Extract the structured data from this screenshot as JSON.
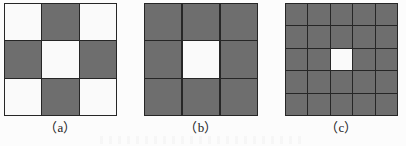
{
  "figure": {
    "background_color": "#fcfcfc",
    "cell_gray_color": "#6e6e6e",
    "cell_white_color": "#fafafa",
    "grid_line_color": "#262626",
    "caption_color": "#232323"
  },
  "panels": [
    {
      "id": "a",
      "caption": "（a）",
      "rows": 3,
      "cols": 3,
      "cells": [
        "white",
        "gray",
        "white",
        "gray",
        "white",
        "gray",
        "white",
        "gray",
        "white"
      ]
    },
    {
      "id": "b",
      "caption": "（b）",
      "rows": 3,
      "cols": 3,
      "cells": [
        "gray",
        "gray",
        "gray",
        "gray",
        "white",
        "gray",
        "gray",
        "gray",
        "gray"
      ]
    },
    {
      "id": "c",
      "caption": "（c）",
      "rows": 5,
      "cols": 5,
      "cells": [
        "gray",
        "gray",
        "gray",
        "gray",
        "gray",
        "gray",
        "gray",
        "gray",
        "gray",
        "gray",
        "gray",
        "gray",
        "white",
        "gray",
        "gray",
        "gray",
        "gray",
        "gray",
        "gray",
        "gray",
        "gray",
        "gray",
        "gray",
        "gray",
        "gray"
      ]
    }
  ]
}
